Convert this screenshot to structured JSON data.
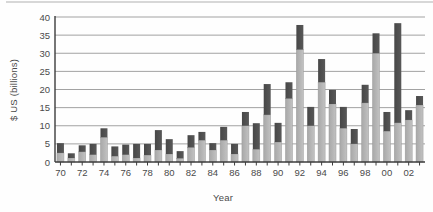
{
  "figure": {
    "background": "#fefefe",
    "top_rule_color": "#d7d7d7"
  },
  "chart_data": {
    "type": "bar",
    "stacked": true,
    "title": "",
    "xlabel": "Year",
    "ylabel": "$ US (billions)",
    "ylim": [
      0,
      40
    ],
    "grid": true,
    "legend": false,
    "ytick_values": [
      0,
      5,
      10,
      15,
      20,
      25,
      30,
      35,
      40
    ],
    "ytick_labels": [
      "0",
      "5",
      "10",
      "15",
      "20",
      "25",
      "30",
      "35",
      "40"
    ],
    "xtick_labels": [
      "70",
      "72",
      "74",
      "76",
      "78",
      "80",
      "82",
      "84",
      "86",
      "88",
      "90",
      "92",
      "94",
      "96",
      "98",
      "00",
      "02"
    ],
    "categories": [
      "70",
      "71",
      "72",
      "73",
      "74",
      "75",
      "76",
      "77",
      "78",
      "79",
      "80",
      "81",
      "82",
      "83",
      "84",
      "85",
      "86",
      "87",
      "88",
      "89",
      "90",
      "91",
      "92",
      "93",
      "94",
      "95",
      "96",
      "97",
      "98",
      "99",
      "00",
      "01",
      "02",
      "03"
    ],
    "series": [
      {
        "name": "light-gray-lower-segment",
        "color": "#b3b3b3",
        "values": [
          2.5,
          1.1,
          2.8,
          2.0,
          6.8,
          1.6,
          2.0,
          1.1,
          1.9,
          3.3,
          2.2,
          1.0,
          4.0,
          6.0,
          3.3,
          6.0,
          2.2,
          10.0,
          3.5,
          13.0,
          5.5,
          17.5,
          31.0,
          10.0,
          22.0,
          16.0,
          9.3,
          5.0,
          16.3,
          30.0,
          8.5,
          10.8,
          11.6,
          15.7
        ]
      },
      {
        "name": "dark-gray-upper-segment",
        "color": "#4f4f4f",
        "values": [
          2.7,
          1.3,
          1.8,
          3.0,
          2.5,
          2.7,
          2.8,
          3.9,
          3.1,
          5.5,
          4.1,
          2.0,
          3.4,
          2.3,
          1.9,
          3.7,
          2.8,
          3.8,
          7.2,
          8.5,
          5.3,
          4.5,
          6.8,
          5.2,
          6.4,
          3.9,
          5.9,
          4.1,
          5.0,
          5.5,
          5.3,
          27.5,
          2.7,
          2.5
        ]
      }
    ],
    "colors": {
      "grid": "#a2a2a2",
      "axis": "#3c3c3c",
      "tick_text": "#4a4a4a",
      "bar_light_edge": "#9a9a9a"
    }
  }
}
